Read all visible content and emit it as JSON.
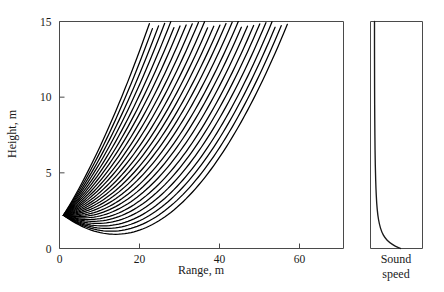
{
  "figure": {
    "background_color": "#ffffff",
    "line_color": "#000000",
    "frame_color": "#4a4a4a"
  },
  "main_panel": {
    "xlabel": "Range, m",
    "ylabel": "Height, m",
    "x_ticks": [
      0,
      20,
      40,
      60
    ],
    "y_ticks": [
      0,
      5,
      10,
      15
    ],
    "x_tick_labels": [
      "0",
      "20",
      "40",
      "60"
    ],
    "y_tick_labels": [
      "0",
      "5",
      "10",
      "15"
    ],
    "xlim": [
      0,
      71
    ],
    "ylim": [
      0,
      15
    ],
    "grid": false
  },
  "side_panel": {
    "caption_line1": "Sound",
    "caption_line2": "speed",
    "xlabel": "Sound speed",
    "ylim": [
      0,
      15
    ],
    "axis_visible": false
  },
  "chart_data": {
    "type": "line",
    "title": "",
    "xlabel": "Range, m",
    "ylabel": "Height, m",
    "xlim": [
      0,
      71
    ],
    "ylim": [
      0,
      15
    ],
    "x_ticks": [
      0,
      20,
      40,
      60
    ],
    "y_ticks": [
      0,
      5,
      10,
      15
    ],
    "grid": false,
    "legend": null,
    "source": {
      "range_m": 1.0,
      "height_m": 2.2
    },
    "curvature": 0.0075,
    "ray_count": 26,
    "launch_angles_deg": [
      23.2,
      21.2,
      19.2,
      17.3,
      15.4,
      13.6,
      11.9,
      10.2,
      8.6,
      7.1,
      5.6,
      4.2,
      2.9,
      1.6,
      0.4,
      -0.8,
      -2.0,
      -3.1,
      -4.2,
      -5.3,
      -6.3,
      -7.3,
      -8.3,
      -9.2,
      -10.1,
      -11.0
    ],
    "ray_end_range_m": 70.0,
    "series": [
      {
        "name": "Sound speed profile",
        "panel": "side",
        "type": "line",
        "x": [
          1.0,
          1.0,
          1.0,
          1.01,
          1.01,
          1.02,
          1.03,
          1.05,
          1.07,
          1.1,
          1.15,
          1.22,
          1.33,
          1.5,
          1.75,
          2.1,
          2.6,
          3.3,
          4.2,
          5.0
        ],
        "y": [
          15.0,
          14.0,
          13.0,
          12.0,
          11.0,
          10.0,
          9.0,
          8.0,
          7.0,
          6.0,
          5.0,
          4.0,
          3.0,
          2.2,
          1.6,
          1.1,
          0.7,
          0.4,
          0.15,
          0.0
        ]
      }
    ]
  }
}
